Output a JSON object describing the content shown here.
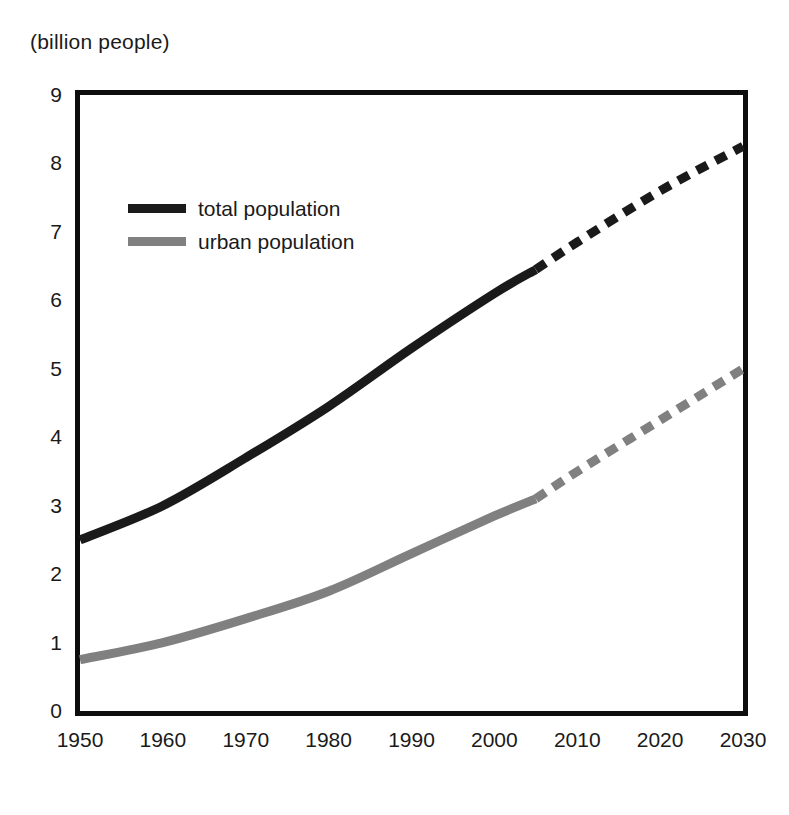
{
  "chart_data": {
    "type": "line",
    "title": "(billion people)",
    "xlabel": "",
    "ylabel": "(billion people)",
    "xlim": [
      1950,
      2030
    ],
    "ylim": [
      0,
      9
    ],
    "grid": false,
    "legend_position": "upper-left-inside",
    "x_ticks": [
      "1950",
      "1960",
      "1970",
      "1980",
      "1990",
      "2000",
      "2010",
      "2020",
      "2030"
    ],
    "y_ticks": [
      "0",
      "1",
      "2",
      "3",
      "4",
      "5",
      "6",
      "7",
      "8",
      "9"
    ],
    "x": [
      1950,
      1960,
      1970,
      1980,
      1990,
      2000,
      2005,
      2010,
      2020,
      2030
    ],
    "projection_start_year": 2005,
    "series": [
      {
        "name": "total population",
        "color": "#1a1a1a",
        "values": [
          2.5,
          3.0,
          3.7,
          4.45,
          5.3,
          6.1,
          6.45,
          6.85,
          7.6,
          8.25
        ],
        "historical_values": [
          2.5,
          3.0,
          3.7,
          4.45,
          5.3,
          6.1,
          6.45
        ],
        "projected_values": [
          6.45,
          6.85,
          7.6,
          8.25
        ]
      },
      {
        "name": "urban population",
        "color": "#808080",
        "values": [
          0.75,
          1.0,
          1.35,
          1.75,
          2.3,
          2.85,
          3.1,
          3.5,
          4.25,
          5.0
        ],
        "historical_values": [
          0.75,
          1.0,
          1.35,
          1.75,
          2.3,
          2.85,
          3.1
        ],
        "projected_values": [
          3.1,
          3.5,
          4.25,
          5.0
        ]
      }
    ]
  },
  "legend": {
    "items": [
      {
        "label": "total population",
        "color": "#1a1a1a"
      },
      {
        "label": "urban population",
        "color": "#808080"
      }
    ]
  },
  "colors": {
    "total_population": "#1a1a1a",
    "urban_population": "#808080",
    "frame": "#0d0d0d",
    "background": "#ffffff"
  }
}
